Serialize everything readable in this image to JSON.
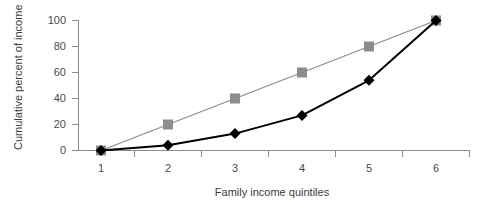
{
  "chart_data": {
    "type": "line",
    "title": "",
    "subtitle": "",
    "xlabel": "Family income quintiles",
    "ylabel": "Cumulative percent of income",
    "categories": [
      "1",
      "2",
      "3",
      "4",
      "5",
      "6"
    ],
    "x": [
      1,
      2,
      3,
      4,
      5,
      6
    ],
    "xlim": [
      1,
      6
    ],
    "ylim": [
      0,
      100
    ],
    "yticks": [
      "0",
      "20",
      "40",
      "60",
      "80",
      "100"
    ],
    "ytick_values": [
      0,
      20,
      40,
      60,
      80,
      100
    ],
    "xticks": [
      "1",
      "2",
      "3",
      "4",
      "5",
      "6"
    ],
    "grid": false,
    "legend": "none",
    "series": [
      {
        "name": "line-of-equality",
        "values": [
          0,
          20,
          40,
          60,
          80,
          100
        ],
        "color": "#8c8c8c",
        "marker": "square",
        "marker_color": "#8c8c8c"
      },
      {
        "name": "cumulative-income",
        "values": [
          0,
          4,
          13,
          27,
          54,
          100
        ],
        "color": "#000000",
        "marker": "diamond",
        "marker_color": "#000000"
      }
    ]
  },
  "axes": {
    "y_title": "Cumulative percent of income",
    "x_title": "Family income quintiles"
  },
  "colors": {
    "equality": "#8c8c8c",
    "actual": "#000000",
    "axis": "#8c8c8c",
    "text": "#4a4a4a",
    "background": "#ffffff"
  }
}
